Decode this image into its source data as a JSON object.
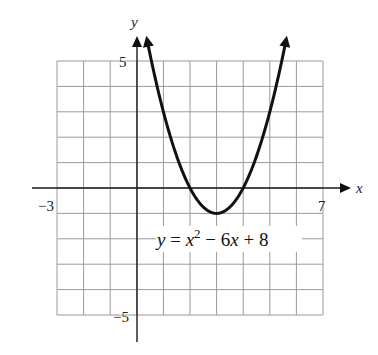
{
  "chart_data": {
    "type": "line",
    "title": "",
    "function": "x^2 - 6x + 8",
    "equation_label": {
      "lhs": "y",
      "eq": " = ",
      "base": "x",
      "exp": "2",
      "rest_1": " − 6",
      "rest_var": "x",
      "rest_2": " + 8"
    },
    "xlabel": "x",
    "ylabel": "y",
    "xlim": [
      -3,
      7
    ],
    "ylim": [
      -5,
      5
    ],
    "grid": true,
    "tick_labels": {
      "x_min": "−3",
      "x_max": "7",
      "y_max": "5",
      "y_min": "−5"
    },
    "vertex": [
      3,
      -1
    ],
    "x_intercepts": [
      2,
      4
    ],
    "y_intercept": 8,
    "x": [
      0.4,
      1,
      1.5,
      2,
      2.5,
      3,
      3.5,
      4,
      4.5,
      5,
      5.6
    ],
    "series": [
      {
        "name": "y = x^2 - 6x + 8",
        "values": [
          5.76,
          3,
          1.25,
          0,
          -0.75,
          -1,
          -0.75,
          0,
          1.25,
          3,
          5.76
        ]
      }
    ],
    "colors": {
      "curve": "#111111",
      "grid": "#9a9a9a",
      "axis": "#1a1a1a"
    }
  }
}
